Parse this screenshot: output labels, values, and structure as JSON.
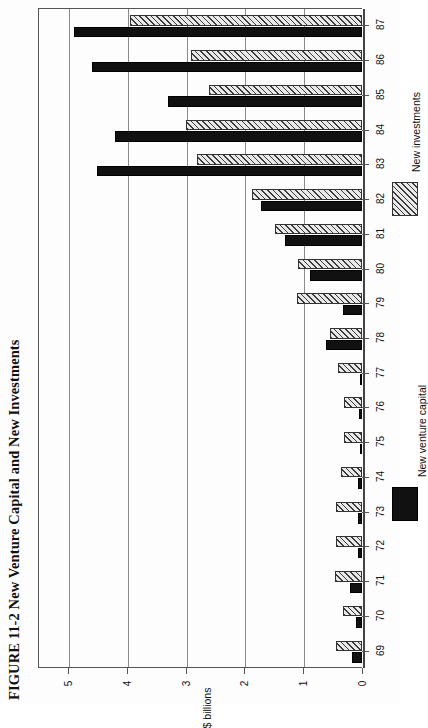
{
  "figure": {
    "label": "FIGURE 11-2",
    "caption": "New Venture Capital and New Investments",
    "full_title": "FIGURE 11-2 New Venture Capital and New Investments"
  },
  "legend": {
    "position": "right",
    "items": [
      {
        "label": "New venture capital",
        "swatch": "solid-black",
        "color": "#111111"
      },
      {
        "label": "New investments",
        "swatch": "diagonal-hatch",
        "color": "#3a3a3a"
      }
    ]
  },
  "axes": {
    "value_axis_label": "$ billions",
    "value_ticks": [
      "0",
      "1",
      "2",
      "3",
      "4",
      "5"
    ],
    "category_ticks": [
      "69",
      "70",
      "71",
      "72",
      "73",
      "74",
      "75",
      "76",
      "77",
      "78",
      "79",
      "80",
      "81",
      "82",
      "83",
      "84",
      "85",
      "86",
      "87"
    ]
  },
  "chart_data": {
    "type": "bar",
    "orientation": "horizontal",
    "title": "FIGURE 11-2 New Venture Capital and New Investments",
    "xlabel": "$ billions",
    "ylabel": "",
    "xlim": [
      0,
      5
    ],
    "grid": true,
    "legend_position": "right",
    "categories": [
      "69",
      "70",
      "71",
      "72",
      "73",
      "74",
      "75",
      "76",
      "77",
      "78",
      "79",
      "80",
      "81",
      "82",
      "83",
      "84",
      "85",
      "86",
      "87"
    ],
    "series": [
      {
        "name": "New venture capital",
        "style": "solid-black",
        "values": [
          0.17,
          0.1,
          0.2,
          0.06,
          0.06,
          0.06,
          0.01,
          0.05,
          0.04,
          0.61,
          0.32,
          0.88,
          1.31,
          1.72,
          4.5,
          4.2,
          3.3,
          4.6,
          4.9
        ]
      },
      {
        "name": "New investments",
        "style": "diagonal-hatch",
        "values": [
          0.45,
          0.33,
          0.46,
          0.44,
          0.45,
          0.35,
          0.3,
          0.31,
          0.4,
          0.54,
          1.1,
          1.09,
          1.48,
          1.87,
          2.8,
          3.0,
          2.6,
          2.9,
          3.95
        ]
      }
    ]
  }
}
